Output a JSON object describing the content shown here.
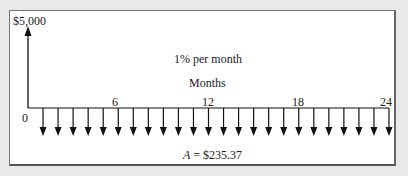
{
  "diagram": {
    "present_value_label": "$5,000",
    "rate_label": "1% per month",
    "axis_label": "Months",
    "origin_label": "0",
    "tick_labels": [
      "6",
      "12",
      "18",
      "24"
    ],
    "tick_label_periods": [
      6,
      12,
      18,
      24
    ],
    "periods": 24,
    "annuity_label_var": "A",
    "annuity_label_eq": " = $235.37",
    "colors": {
      "background": "#e9e9e9",
      "panel": "#ffffff",
      "ink": "#111111"
    }
  }
}
